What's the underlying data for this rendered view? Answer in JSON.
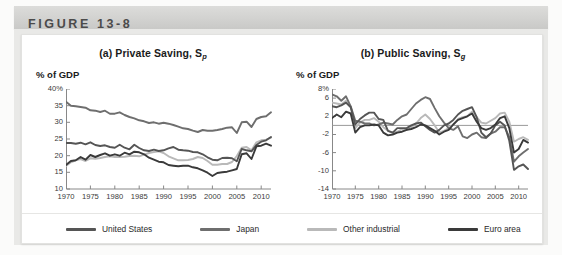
{
  "figure": {
    "header_label": "FIGURE 13-8"
  },
  "legend": {
    "items": [
      {
        "label": "United States",
        "color": "#555555"
      },
      {
        "label": "Japan",
        "color": "#6e6e6e"
      },
      {
        "label": "Other industrial",
        "color": "#b9b9b9"
      },
      {
        "label": "Euro area",
        "color": "#3a3a3a"
      }
    ]
  },
  "chart_data": [
    {
      "type": "line",
      "panel": "a",
      "title": "(a) Private Saving, S",
      "title_sub": "p",
      "ylabel": "% of GDP",
      "xlabel": "",
      "ylim": [
        10,
        40
      ],
      "xlim": [
        1970,
        2012
      ],
      "yticks": [
        "40%",
        "35",
        "30",
        "25",
        "20",
        "15",
        "10"
      ],
      "ytick_values": [
        40,
        35,
        30,
        25,
        20,
        15,
        10
      ],
      "xticks": [
        "1970",
        "1975",
        "1980",
        "1985",
        "1990",
        "1995",
        "2000",
        "2005",
        "2010"
      ],
      "xtick_values": [
        1970,
        1975,
        1980,
        1985,
        1990,
        1995,
        2000,
        2005,
        2010
      ],
      "grid": false,
      "x": [
        1970,
        1971,
        1972,
        1973,
        1974,
        1975,
        1976,
        1977,
        1978,
        1979,
        1980,
        1981,
        1982,
        1983,
        1984,
        1985,
        1986,
        1987,
        1988,
        1989,
        1990,
        1991,
        1992,
        1993,
        1994,
        1995,
        1996,
        1997,
        1998,
        1999,
        2000,
        2001,
        2002,
        2003,
        2004,
        2005,
        2006,
        2007,
        2008,
        2009,
        2010,
        2011,
        2012
      ],
      "series": [
        {
          "name": "Japan",
          "color": "#6e6e6e",
          "values": [
            36.2,
            35.0,
            34.8,
            34.6,
            34.4,
            33.6,
            33.5,
            33.1,
            33.5,
            32.6,
            32.6,
            33.0,
            32.2,
            31.6,
            31.2,
            30.6,
            30.3,
            29.8,
            30.0,
            29.6,
            29.9,
            29.6,
            29.2,
            28.7,
            28.2,
            28.0,
            27.5,
            27.1,
            27.7,
            27.5,
            27.5,
            27.7,
            28.0,
            28.4,
            28.5,
            26.8,
            30.0,
            30.2,
            28.6,
            31.0,
            31.6,
            31.8,
            33.0
          ]
        },
        {
          "name": "United States",
          "color": "#555555",
          "values": [
            23.8,
            23.8,
            23.6,
            23.9,
            23.4,
            24.0,
            23.2,
            22.9,
            23.1,
            22.6,
            22.4,
            23.3,
            22.4,
            21.9,
            23.3,
            22.3,
            21.6,
            21.4,
            21.8,
            21.4,
            21.6,
            22.2,
            22.6,
            21.8,
            21.6,
            21.5,
            21.1,
            21.0,
            20.4,
            19.5,
            18.8,
            18.6,
            19.3,
            19.4,
            19.2,
            18.3,
            22.0,
            21.6,
            21.3,
            23.2,
            24.2,
            24.6,
            25.6
          ]
        },
        {
          "name": "Other industrial",
          "color": "#b9b9b9",
          "values": [
            16.9,
            18.0,
            18.6,
            19.0,
            18.4,
            19.2,
            19.1,
            19.3,
            19.6,
            19.8,
            19.6,
            19.6,
            19.7,
            19.9,
            20.0,
            19.8,
            20.3,
            20.8,
            21.1,
            21.3,
            20.8,
            19.8,
            19.2,
            18.6,
            18.6,
            18.7,
            19.0,
            19.6,
            19.3,
            18.4,
            17.3,
            17.3,
            17.5,
            17.5,
            18.1,
            19.9,
            22.4,
            22.6,
            21.6,
            24.0,
            24.6,
            24.8,
            25.4
          ]
        },
        {
          "name": "Euro area",
          "color": "#3a3a3a",
          "values": [
            17.2,
            18.4,
            18.6,
            19.6,
            18.8,
            20.2,
            19.6,
            20.2,
            20.7,
            20.0,
            20.4,
            20.0,
            20.9,
            20.4,
            21.2,
            21.0,
            20.4,
            19.4,
            18.8,
            18.2,
            18.0,
            17.2,
            17.0,
            16.8,
            17.0,
            17.0,
            16.5,
            16.2,
            15.6,
            14.9,
            13.9,
            14.8,
            15.0,
            15.2,
            15.6,
            16.0,
            20.4,
            20.7,
            19.0,
            22.8,
            23.0,
            23.6,
            23.0
          ]
        }
      ]
    },
    {
      "type": "line",
      "panel": "b",
      "title": "(b) Public Saving, S",
      "title_sub": "g",
      "ylabel": "% of GDP",
      "xlabel": "",
      "ylim": [
        -14,
        8
      ],
      "xlim": [
        1970,
        2012
      ],
      "yticks": [
        "8%",
        "6",
        "2",
        "-2",
        "-6",
        "-10",
        "-14"
      ],
      "ytick_values": [
        8,
        6,
        2,
        -2,
        -6,
        -10,
        -14
      ],
      "xticks": [
        "1970",
        "1975",
        "1980",
        "1985",
        "1990",
        "1995",
        "2000",
        "2005",
        "2010"
      ],
      "xtick_values": [
        1970,
        1975,
        1980,
        1985,
        1990,
        1995,
        2000,
        2005,
        2010
      ],
      "zero_line": 0,
      "grid": false,
      "x": [
        1970,
        1971,
        1972,
        1973,
        1974,
        1975,
        1976,
        1977,
        1978,
        1979,
        1980,
        1981,
        1982,
        1983,
        1984,
        1985,
        1986,
        1987,
        1988,
        1989,
        1990,
        1991,
        1992,
        1993,
        1994,
        1995,
        1996,
        1997,
        1998,
        1999,
        2000,
        2001,
        2002,
        2003,
        2004,
        2005,
        2006,
        2007,
        2008,
        2009,
        2010,
        2011,
        2012
      ],
      "series": [
        {
          "name": "Japan",
          "color": "#6e6e6e",
          "values": [
            6.8,
            6.4,
            5.4,
            6.4,
            4.2,
            1.0,
            0.8,
            0.4,
            0.4,
            0.0,
            0.2,
            0.6,
            0.4,
            0.2,
            1.2,
            2.0,
            2.4,
            3.6,
            4.8,
            5.6,
            6.2,
            5.8,
            3.8,
            2.0,
            0.6,
            -0.6,
            -1.0,
            -0.2,
            -2.4,
            -2.8,
            -2.0,
            -1.6,
            -2.6,
            -2.8,
            -1.8,
            -1.4,
            -0.4,
            -0.4,
            -2.6,
            -8.0,
            -6.8,
            -6.0,
            -5.2
          ]
        },
        {
          "name": "United States",
          "color": "#555555",
          "values": [
            4.2,
            4.0,
            4.4,
            5.0,
            4.0,
            0.2,
            1.4,
            2.2,
            2.8,
            2.8,
            1.4,
            1.2,
            -1.2,
            -1.6,
            -0.6,
            -0.6,
            -0.6,
            0.0,
            0.4,
            0.6,
            -0.2,
            -1.0,
            -1.6,
            -1.0,
            0.0,
            0.4,
            1.2,
            2.4,
            3.2,
            3.6,
            4.0,
            1.8,
            -1.6,
            -2.6,
            -1.8,
            0.0,
            0.8,
            0.0,
            -3.4,
            -9.8,
            -9.0,
            -8.6,
            -9.6
          ]
        },
        {
          "name": "Other industrial",
          "color": "#b9b9b9",
          "values": [
            5.0,
            4.8,
            4.6,
            5.4,
            4.2,
            -0.6,
            0.6,
            1.2,
            1.2,
            1.6,
            0.8,
            -0.4,
            -1.2,
            -1.6,
            -1.4,
            -0.8,
            -1.0,
            -0.4,
            0.4,
            1.6,
            2.4,
            1.4,
            0.0,
            -1.6,
            -1.2,
            -0.6,
            0.2,
            1.4,
            1.8,
            2.0,
            3.0,
            1.8,
            0.6,
            0.4,
            1.0,
            1.6,
            2.6,
            2.8,
            0.8,
            -3.6,
            -3.0,
            -2.6,
            -3.2
          ]
        },
        {
          "name": "Euro area",
          "color": "#3a3a3a",
          "values": [
            1.6,
            2.4,
            1.8,
            3.0,
            2.6,
            -1.6,
            -0.4,
            0.0,
            0.0,
            0.2,
            0.0,
            -1.6,
            -2.2,
            -2.0,
            -1.6,
            -1.4,
            -1.0,
            -0.8,
            -0.4,
            0.2,
            0.0,
            -0.6,
            -1.2,
            -2.0,
            -1.4,
            -1.0,
            0.2,
            1.2,
            1.6,
            2.0,
            2.6,
            0.8,
            -0.6,
            -1.0,
            -0.6,
            0.2,
            1.6,
            2.0,
            -0.6,
            -6.0,
            -5.2,
            -3.2,
            -3.8
          ]
        }
      ]
    }
  ]
}
